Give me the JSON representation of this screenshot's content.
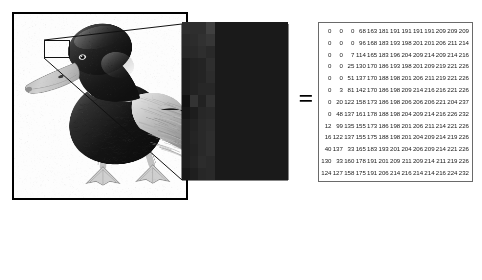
{
  "figure": {
    "equals_symbol": "=",
    "caption": "",
    "panels": {
      "photo": {
        "name": "duck-photograph",
        "subject": "mallard duck, grayscale photograph",
        "selection_label": ""
      },
      "magnified": {
        "name": "magnified-pixel-block",
        "grid_cols": 13,
        "grid_rows": 13
      },
      "matrix": {
        "name": "pixel-value-matrix",
        "rows": 13,
        "cols": 13
      }
    }
  },
  "chart_data": {
    "type": "heatmap",
    "title": "",
    "subtitle": "",
    "xlabel": "",
    "ylabel": "",
    "grid": false,
    "legend": "none",
    "colormap": "grayscale",
    "vmin": 0,
    "vmax": 255,
    "cols": 13,
    "rows": 13,
    "values": [
      [
        0,
        0,
        0,
        68,
        163,
        181,
        191,
        191,
        191,
        191,
        209,
        209,
        209
      ],
      [
        0,
        0,
        0,
        96,
        168,
        183,
        193,
        198,
        201,
        201,
        206,
        211,
        214
      ],
      [
        0,
        0,
        7,
        114,
        165,
        183,
        196,
        204,
        209,
        214,
        209,
        214,
        216
      ],
      [
        0,
        0,
        25,
        130,
        170,
        186,
        193,
        198,
        201,
        209,
        219,
        221,
        226
      ],
      [
        0,
        0,
        51,
        137,
        170,
        188,
        198,
        201,
        206,
        211,
        219,
        221,
        226
      ],
      [
        0,
        3,
        81,
        142,
        170,
        186,
        198,
        209,
        214,
        216,
        216,
        221,
        226
      ],
      [
        0,
        20,
        122,
        158,
        173,
        186,
        198,
        206,
        206,
        206,
        221,
        204,
        237
      ],
      [
        0,
        48,
        137,
        161,
        178,
        188,
        198,
        204,
        209,
        214,
        216,
        226,
        232
      ],
      [
        12,
        99,
        135,
        155,
        173,
        186,
        198,
        201,
        206,
        211,
        214,
        221,
        226
      ],
      [
        16,
        122,
        137,
        155,
        175,
        188,
        198,
        201,
        204,
        209,
        214,
        219,
        226
      ],
      [
        40,
        137,
        33,
        165,
        183,
        193,
        201,
        204,
        206,
        209,
        214,
        221,
        226
      ],
      [
        130,
        33,
        160,
        178,
        191,
        201,
        209,
        211,
        209,
        214,
        211,
        219,
        226
      ],
      [
        124,
        127,
        158,
        175,
        191,
        206,
        214,
        216,
        214,
        214,
        216,
        224,
        232
      ]
    ]
  },
  "colors": {
    "frame_border": "#000000",
    "matrix_border": "#6a6a6a",
    "text": "#1a1a1a",
    "background": "#ffffff",
    "pixel_dark": "#0a0a0a",
    "pixel_light": "#ffffff"
  }
}
